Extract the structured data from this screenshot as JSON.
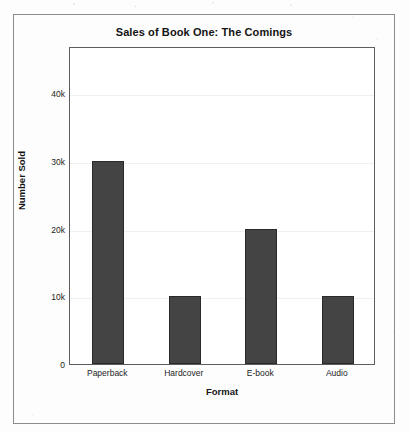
{
  "chart_data": {
    "type": "bar",
    "title": "Sales of Book One: The Comings",
    "xlabel": "Format",
    "ylabel": "Number Sold",
    "categories": [
      "Paperback",
      "Hardcover",
      "E-book",
      "Audio"
    ],
    "values": [
      30000,
      10000,
      20000,
      10000
    ],
    "value_labels": [
      "30k",
      "10k",
      "20k",
      "10k"
    ],
    "yticks": [
      0,
      10000,
      20000,
      30000,
      40000
    ],
    "ytick_labels": [
      "0",
      "10k",
      "20k",
      "30k",
      "40k"
    ],
    "ylim": [
      0,
      47000
    ],
    "grid": true,
    "legend": null,
    "series": [
      {
        "name": "Number Sold",
        "values": [
          30000,
          10000,
          20000,
          10000
        ]
      }
    ],
    "colors": {
      "bar_fill": "#444444",
      "bar_edge": "#2a2a2a",
      "grid": "#f0f0f0",
      "axis": "#5e5e5e",
      "outer_frame": "#8c8c8c",
      "text": "#141414",
      "background": "#ffffff"
    }
  }
}
